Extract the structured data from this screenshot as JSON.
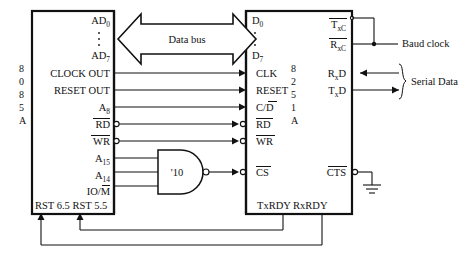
{
  "diagram": {
    "type": "schematic",
    "colors": {
      "ink": "#111111",
      "background": "#ffffff"
    }
  },
  "cpu": {
    "name": "8085A",
    "id_chars": [
      "8",
      "0",
      "8",
      "5",
      "A"
    ],
    "pins_right": [
      {
        "label": "AD",
        "sub": "0"
      },
      {
        "label": "AD",
        "sub": "7"
      },
      {
        "label": "CLOCK OUT",
        "sub": ""
      },
      {
        "label": "RESET OUT",
        "sub": ""
      },
      {
        "label": "A",
        "sub": "8"
      },
      {
        "label": "RD",
        "sub": "",
        "active_low": true
      },
      {
        "label": "WR",
        "sub": "",
        "active_low": true
      },
      {
        "label": "A",
        "sub": "15"
      },
      {
        "label": "A",
        "sub": "14"
      },
      {
        "label": "IO/M",
        "sub": "",
        "overbar_tail": "M"
      }
    ],
    "pins_bottom": [
      {
        "label": "RST 6.5"
      },
      {
        "label": "RST 5.5"
      }
    ],
    "bottom_text": "RST 6.5 RST 5.5"
  },
  "usart": {
    "name": "8251A",
    "id_chars": [
      "8",
      "2",
      "5",
      "1",
      "A"
    ],
    "pins_left": [
      {
        "label": "D",
        "sub": "0"
      },
      {
        "label": "D",
        "sub": "7"
      },
      {
        "label": "CLK",
        "sub": ""
      },
      {
        "label": "RESET",
        "sub": ""
      },
      {
        "label": "C/D",
        "sub": "",
        "overbar_tail": "D"
      },
      {
        "label": "RD",
        "sub": "",
        "active_low": true
      },
      {
        "label": "WR",
        "sub": "",
        "active_low": true
      },
      {
        "label": "CS",
        "sub": "",
        "active_low": true
      }
    ],
    "pins_right": [
      {
        "label": "T",
        "sub": "xC",
        "overbar": true
      },
      {
        "label": "R",
        "sub": "xC",
        "overbar": true
      },
      {
        "label": "R",
        "sub": "x",
        "tail": "D"
      },
      {
        "label": "T",
        "sub": "x",
        "tail": "D"
      },
      {
        "label": "CTS",
        "sub": "",
        "active_low": true
      }
    ],
    "pins_bottom": [
      {
        "label": "TxRDY"
      },
      {
        "label": "RxRDY"
      }
    ],
    "bottom_text": "TxRDY RxRDY"
  },
  "gate": {
    "name": "'10",
    "type": "3-input NAND",
    "inputs": [
      "A15",
      "A14",
      "IO/M"
    ],
    "output": "CS"
  },
  "bus": {
    "label": "Data bus",
    "direction": "bidirectional"
  },
  "external": {
    "baud_clock": "Baud clock",
    "serial_data": "Serial Data",
    "ground": "GND"
  },
  "connections": [
    {
      "from": "CLOCK OUT",
      "to": "CLK"
    },
    {
      "from": "RESET OUT",
      "to": "RESET"
    },
    {
      "from": "A8",
      "to": "C/D"
    },
    {
      "from": "RD",
      "to": "RD"
    },
    {
      "from": "WR",
      "to": "WR"
    },
    {
      "from": "NAND output",
      "to": "CS"
    },
    {
      "from": "TxRDY",
      "to": "RST 5.5"
    },
    {
      "from": "RxRDY",
      "to": "RST 6.5"
    },
    {
      "from": "CTS",
      "to": "GND"
    }
  ]
}
